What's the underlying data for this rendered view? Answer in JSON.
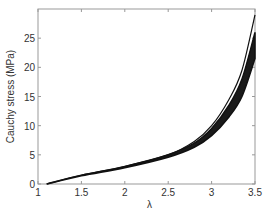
{
  "chart_data": {
    "type": "line",
    "title": "",
    "xlabel": "λ",
    "ylabel": "Cauchy stress (MPa)",
    "xlim": [
      1,
      3.5
    ],
    "ylim": [
      0,
      30
    ],
    "xticks": [
      1,
      1.5,
      2,
      2.5,
      3,
      3.5
    ],
    "xtick_labels": [
      "1",
      "1.5",
      "2",
      "2.5",
      "3",
      "3.5"
    ],
    "yticks": [
      0,
      5,
      10,
      15,
      20,
      25
    ],
    "ytick_labels": [
      "0",
      "5",
      "10",
      "15",
      "20",
      "25"
    ],
    "grid": false,
    "legend": null,
    "series": [
      {
        "name": "upper curve",
        "x": [
          1.1,
          1.5,
          2.0,
          2.5,
          2.8,
          3.0,
          3.2,
          3.35,
          3.5
        ],
        "values": [
          0,
          1.5,
          3.0,
          5.0,
          7.3,
          10.0,
          14.5,
          19.5,
          29.0
        ]
      },
      {
        "name": "band upper",
        "x": [
          1.1,
          1.5,
          2.0,
          2.5,
          2.8,
          3.0,
          3.2,
          3.35,
          3.5
        ],
        "values": [
          0,
          1.5,
          3.0,
          5.0,
          7.0,
          9.5,
          13.5,
          18.0,
          26.0
        ]
      },
      {
        "name": "band lower",
        "x": [
          1.1,
          1.5,
          2.0,
          2.5,
          2.8,
          3.0,
          3.2,
          3.35,
          3.5
        ],
        "values": [
          0,
          1.4,
          2.8,
          4.6,
          6.3,
          8.3,
          11.5,
          15.0,
          21.5
        ]
      }
    ]
  }
}
